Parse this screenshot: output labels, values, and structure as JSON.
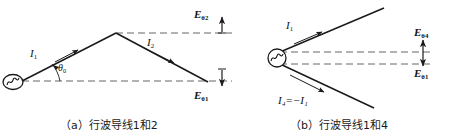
{
  "figure": {
    "panel_a": {
      "caption": "（a）行波导线1和2",
      "labels": {
        "current1": "I",
        "current1_sub": "1",
        "current2": "I",
        "current2_sub": "2",
        "angle": "θ",
        "angle_sub": "0",
        "field_top": "E",
        "field_top_sub": "θ2",
        "field_bottom": "E",
        "field_bottom_sub": "θ1"
      },
      "source_icon": "sine-source-icon"
    },
    "panel_b": {
      "caption": "（b）行波导线1和4",
      "labels": {
        "current1": "I",
        "current1_sub": "1",
        "current4": "I₄=−I₁",
        "field_top": "E",
        "field_top_sub": "θ4",
        "field_bottom": "E",
        "field_bottom_sub": "θ1"
      },
      "source_icon": "sine-source-icon"
    },
    "colors": {
      "wire": "#1a1a1a",
      "dashed_axis": "#555555",
      "text": "#111111",
      "background": "#ffffff"
    }
  }
}
